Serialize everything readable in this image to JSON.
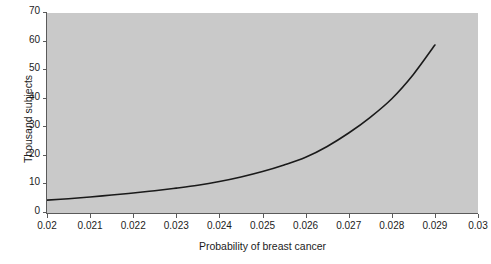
{
  "chart_data": {
    "type": "line",
    "title": "",
    "xlabel": "Probability of breast cancer",
    "ylabel": "Thousand subjects",
    "xlim": [
      0.02,
      0.03
    ],
    "ylim": [
      0,
      70
    ],
    "grid": false,
    "legend": null,
    "xticks": [
      "0.02",
      "0.021",
      "0.022",
      "0.023",
      "0.024",
      "0.025",
      "0.026",
      "0.027",
      "0.028",
      "0.029",
      "0.03"
    ],
    "xtick_values": [
      0.02,
      0.021,
      0.022,
      0.023,
      0.024,
      0.025,
      0.026,
      0.027,
      0.028,
      0.029,
      0.03
    ],
    "yticks": [
      "0",
      "10",
      "20",
      "30",
      "40",
      "50",
      "60",
      "70"
    ],
    "ytick_values": [
      0,
      10,
      20,
      30,
      40,
      50,
      60,
      70
    ],
    "series": [
      {
        "name": "Sample size",
        "color": "#1a1a1a",
        "x": [
          0.02,
          0.0205,
          0.021,
          0.0215,
          0.022,
          0.0225,
          0.023,
          0.0235,
          0.024,
          0.0245,
          0.025,
          0.0255,
          0.026,
          0.0265,
          0.027,
          0.0275,
          0.028,
          0.0285,
          0.029
        ],
        "y": [
          4.5,
          5.0,
          5.6,
          6.3,
          7.0,
          7.8,
          8.7,
          9.7,
          11.0,
          12.6,
          14.5,
          16.8,
          19.5,
          23.3,
          28.0,
          33.5,
          40.0,
          48.5,
          58.8
        ]
      }
    ]
  },
  "axes": {
    "plot_bg_color": "#c9c9c9",
    "axis_color": "#5a5a5a",
    "text_color": "#1c1c1c"
  }
}
